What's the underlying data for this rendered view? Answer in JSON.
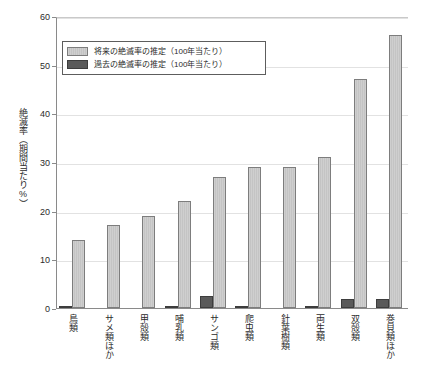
{
  "chart_data": {
    "type": "bar",
    "title": "",
    "subtitle": "",
    "xlabel": "",
    "ylabel": "絶滅率（期間当たり%）",
    "ylim": [
      0,
      60
    ],
    "yticks": [
      0,
      10,
      20,
      30,
      40,
      50,
      60
    ],
    "ytick_labels": [
      "0",
      "10",
      "20",
      "30",
      "40",
      "50",
      "60"
    ],
    "grid": true,
    "grid_axis": "y",
    "legend_position": "upper-left-inside",
    "categories": [
      "鳥類",
      "サメ類ほか",
      "甲殻類",
      "哺乳類",
      "サンゴ類",
      "爬虫類",
      "針葉樹類",
      "両生類",
      "双殻類",
      "巻貝類ほか"
    ],
    "series": [
      {
        "name": "将来の絶滅率の推定（100年当たり）",
        "color": "#c9c9c9",
        "values": [
          14,
          17,
          19,
          22,
          27,
          29,
          29,
          31,
          47,
          56
        ]
      },
      {
        "name": "過去の絶滅率の推定（100年当たり）",
        "color": "#5a5a5a",
        "values": [
          0.2,
          0,
          0,
          0.2,
          2.5,
          0.2,
          0,
          0.2,
          1.8,
          1.8
        ]
      }
    ]
  },
  "legend": {
    "items": [
      {
        "label": "将来の絶滅率の推定（100年当たり）",
        "swatch": "future"
      },
      {
        "label": "過去の絶滅率の推定（100年当たり）",
        "swatch": "past"
      }
    ]
  },
  "axes": {
    "y_title": "絶滅率（期間当たり%）"
  }
}
